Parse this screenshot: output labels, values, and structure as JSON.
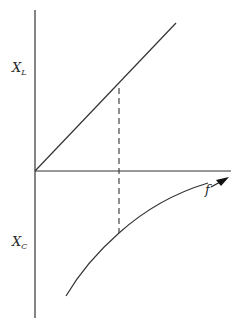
{
  "diagram": {
    "type": "reactance-vs-frequency",
    "labels": {
      "xl_main": "X",
      "xl_sub": "L",
      "xc_main": "X",
      "xc_sub": "C",
      "f": "f"
    },
    "colors": {
      "stroke": "#333333",
      "background": "#ffffff"
    },
    "elements": {
      "vertical_axis": {
        "x": 35,
        "y1": 10,
        "y2": 318
      },
      "horizontal_axis": {
        "y": 171,
        "x1": 35,
        "x2": 231
      },
      "inductive_line": {
        "x1": 35,
        "y1": 171,
        "x2": 176,
        "y2": 23
      },
      "dashed_line": {
        "x": 119,
        "y1": 88,
        "y2": 233
      },
      "capacitive_curve": {
        "start": [
          66,
          296
        ],
        "mid": [
          119,
          233
        ],
        "end": [
          208,
          183
        ]
      },
      "frequency_arrow": {
        "from": [
          207,
          189
        ],
        "to": [
          223,
          180
        ]
      }
    }
  }
}
